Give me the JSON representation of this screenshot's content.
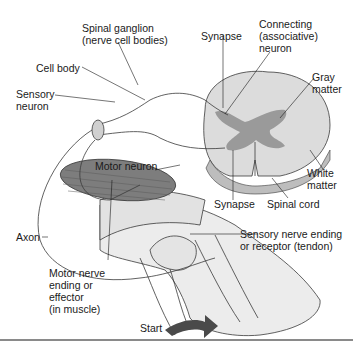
{
  "diagram": {
    "colors": {
      "white_matter": "#dcdcdc",
      "gray_matter": "#9a9a9a",
      "muscle": "#7d7d7d",
      "leg": "#ececec",
      "nerve": "#d0d0d0",
      "outline": "#3a3a3a",
      "start_arrow": "#4a4a4a"
    },
    "labels": {
      "spinal_ganglion": [
        "Spinal ganglion",
        "(nerve cell bodies)"
      ],
      "cell_body": "Cell body",
      "sensory_neuron": [
        "Sensory",
        "neuron"
      ],
      "synapse_top": "Synapse",
      "connecting_neuron": [
        "Connecting",
        "(associative)",
        "neuron"
      ],
      "gray_matter": [
        "Gray",
        "matter"
      ],
      "white_matter": [
        "White",
        "matter"
      ],
      "motor_neuron": "Motor neuron",
      "synapse_bottom": "Synapse",
      "spinal_cord": "Spinal cord",
      "axon": "Axon",
      "sensory_nerve_ending": [
        "Sensory nerve ending",
        "or receptor (tendon)"
      ],
      "motor_nerve_ending": [
        "Motor nerve",
        "ending or",
        "effector",
        "(in muscle)"
      ],
      "start": "Start"
    }
  }
}
